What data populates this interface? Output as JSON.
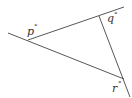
{
  "diagram": {
    "type": "triangle-exterior-angles",
    "labels": [
      {
        "id": "p",
        "text": "p",
        "degree": "°"
      },
      {
        "id": "q",
        "text": "q",
        "degree": "°"
      },
      {
        "id": "r",
        "text": "r",
        "degree": "°"
      }
    ],
    "colors": {
      "line": "#444444",
      "text": "#333333",
      "background": "#ffffff"
    }
  }
}
